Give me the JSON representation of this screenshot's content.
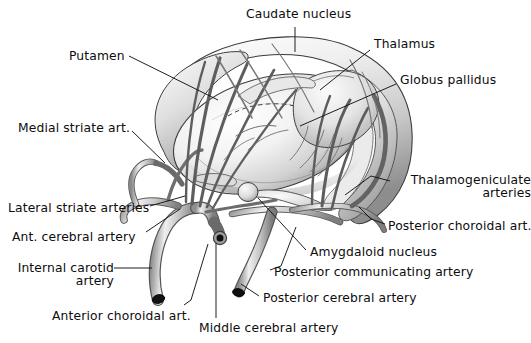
{
  "figure": {
    "background": "#ffffff",
    "ink": "#0d0d0d",
    "style": "grayscale pen-and-ink anatomical illustration with airbrush shading"
  },
  "labels": [
    {
      "id": "caudate-nucleus",
      "text": "Caudate nucleus",
      "lines": [
        "Caudate nucleus"
      ],
      "x": 246,
      "y": 8,
      "align": "left"
    },
    {
      "id": "putamen",
      "text": "Putamen",
      "lines": [
        "Putamen"
      ],
      "x": 69,
      "y": 50,
      "align": "left"
    },
    {
      "id": "thalamus",
      "text": "Thalamus",
      "lines": [
        "Thalamus"
      ],
      "x": 374,
      "y": 38,
      "align": "left"
    },
    {
      "id": "globus-pallidus",
      "text": "Globus pallidus",
      "lines": [
        "Globus pallidus"
      ],
      "x": 400,
      "y": 74,
      "align": "left"
    },
    {
      "id": "medial-striate-art",
      "text": "Medial striate art.",
      "lines": [
        "Medial striate art."
      ],
      "x": 18,
      "y": 122,
      "align": "left"
    },
    {
      "id": "thalamogeniculate-arteries",
      "text": "Thalamogeniculate arteries",
      "lines": [
        "Thalamogeniculate",
        "arteries"
      ],
      "x": 392,
      "y": 174,
      "align": "right"
    },
    {
      "id": "lateral-striate-arteries",
      "text": "Lateral striate arteries",
      "lines": [
        "Lateral striate arteries"
      ],
      "x": 8,
      "y": 202,
      "align": "left"
    },
    {
      "id": "posterior-choroidal-art",
      "text": "Posterior choroidal art.",
      "lines": [
        "Posterior choroidal art."
      ],
      "x": 388,
      "y": 220,
      "align": "left"
    },
    {
      "id": "ant-cerebral-artery",
      "text": "Ant. cerebral artery",
      "lines": [
        "Ant. cerebral artery"
      ],
      "x": 12,
      "y": 231,
      "align": "left"
    },
    {
      "id": "amygdaloid-nucleus",
      "text": "Amygdaloid nucleus",
      "lines": [
        "Amygdaloid nucleus"
      ],
      "x": 310,
      "y": 246,
      "align": "left"
    },
    {
      "id": "internal-carotid-artery",
      "text": "Internal carotid artery",
      "lines": [
        "Internal carotid",
        "artery"
      ],
      "x": 14,
      "y": 262,
      "align": "right"
    },
    {
      "id": "posterior-communicating-artery",
      "text": "Posterior communicating artery",
      "lines": [
        "Posterior communicating artery"
      ],
      "x": 274,
      "y": 266,
      "align": "left"
    },
    {
      "id": "posterior-cerebral-artery",
      "text": "Posterior cerebral artery",
      "lines": [
        "Posterior cerebral artery"
      ],
      "x": 263,
      "y": 292,
      "align": "left"
    },
    {
      "id": "anterior-choroidal-art",
      "text": "Anterior choroidal art.",
      "lines": [
        "Anterior choroidal art."
      ],
      "x": 52,
      "y": 310,
      "align": "left"
    },
    {
      "id": "middle-cerebral-artery",
      "text": "Middle cerebral artery",
      "lines": [
        "Middle cerebral artery"
      ],
      "x": 199,
      "y": 322,
      "align": "left"
    }
  ],
  "leader_lines": [
    {
      "id": "leader-caudate-nucleus",
      "points": "295,27 295,52"
    },
    {
      "id": "leader-putamen",
      "points": "129,56 218,100"
    },
    {
      "id": "leader-thalamus",
      "points": "370,50 320,90"
    },
    {
      "id": "leader-globus-pallidus",
      "points": "396,84 300,126"
    },
    {
      "id": "leader-medial-striate-art",
      "points": "132,131 165,163"
    },
    {
      "id": "leader-thalamogeniculate",
      "points": "390,181 371,176 345,195"
    },
    {
      "id": "leader-lateral-striate-arteries",
      "points": "150,206 185,196"
    },
    {
      "id": "leader-posterior-choroidal-art",
      "points": "385,224 371,219 359,207"
    },
    {
      "id": "leader-ant-cerebral-artery",
      "points": "146,232 180,209"
    },
    {
      "id": "leader-amygdaloid-nucleus",
      "points": "306,250 258,198"
    },
    {
      "id": "leader-internal-carotid-artery",
      "points": "114,268 152,268"
    },
    {
      "id": "leader-posterior-communicating",
      "points": "270,270 281,266 296,227"
    },
    {
      "id": "leader-posterior-cerebral-artery",
      "points": "259,296 241,284"
    },
    {
      "id": "leader-anterior-choroidal-art",
      "points": "184,305 191,300 208,244"
    },
    {
      "id": "leader-middle-cerebral-artery",
      "points": "216,318 216,243"
    }
  ],
  "structures": [
    {
      "id": "caudate-nucleus-body",
      "name": "Caudate nucleus head, body and tail (outer C-shaped arc)"
    },
    {
      "id": "lentiform-nucleus-body",
      "name": "Lentiform nucleus / putamen (large central ovoid)"
    },
    {
      "id": "thalamus-body",
      "name": "Thalamus (posterior ovoid mass)"
    },
    {
      "id": "globus-pallidus-body",
      "name": "Globus pallidus (dashed outline within lentiform nucleus)"
    },
    {
      "id": "amygdaloid-nucleus-body",
      "name": "Amygdaloid nucleus (small bulb, temporal pole)"
    }
  ],
  "vessels": [
    {
      "id": "internal-carotid-artery-vessel",
      "name": "Internal carotid artery",
      "cut_end": true
    },
    {
      "id": "middle-cerebral-artery-vessel",
      "name": "Middle cerebral artery",
      "cut_end": true
    },
    {
      "id": "anterior-cerebral-artery-vessel",
      "name": "Anterior cerebral artery",
      "cut_end": false
    },
    {
      "id": "posterior-cerebral-artery-vessel",
      "name": "Posterior cerebral artery",
      "cut_end": true
    },
    {
      "id": "posterior-communicating-artery-vessel",
      "name": "Posterior communicating artery",
      "cut_end": false
    },
    {
      "id": "anterior-choroidal-artery-vessel",
      "name": "Anterior choroidal artery",
      "cut_end": false
    },
    {
      "id": "posterior-choroidal-artery-vessel",
      "name": "Posterior choroidal artery",
      "cut_end": false
    },
    {
      "id": "medial-striate-artery-vessel",
      "name": "Medial striate artery",
      "cut_end": false
    },
    {
      "id": "lateral-striate-arteries-vessel",
      "name": "Lateral striate arteries",
      "cut_end": false
    },
    {
      "id": "thalamogeniculate-arteries-vessel",
      "name": "Thalamogeniculate arteries",
      "cut_end": false
    }
  ]
}
